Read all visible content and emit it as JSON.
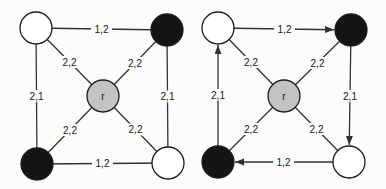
{
  "figure": {
    "background": "#fcfcfb",
    "line_color": "#333333",
    "text_color": "#161616",
    "node_stroke": "#1c1c1c",
    "node_radius": 16,
    "label_font_size": 10,
    "node_colors": {
      "white": "#ffffff",
      "black": "#141414",
      "gray": "#c3c3c2"
    },
    "graphs": [
      {
        "name": "undirected-graph",
        "nodes": [
          {
            "id": "top-left",
            "x": 36,
            "y": 28,
            "fill": "white",
            "label": ""
          },
          {
            "id": "top-right",
            "x": 167,
            "y": 30,
            "fill": "black",
            "label": ""
          },
          {
            "id": "center",
            "x": 103,
            "y": 96,
            "fill": "gray",
            "label": "r"
          },
          {
            "id": "bottom-left",
            "x": 37,
            "y": 164,
            "fill": "black",
            "label": ""
          },
          {
            "id": "bottom-right",
            "x": 168,
            "y": 163,
            "fill": "white",
            "label": ""
          }
        ],
        "edges": [
          {
            "from": "top-left",
            "to": "top-right",
            "label": "1,2",
            "directed": false
          },
          {
            "from": "top-left",
            "to": "bottom-left",
            "label": "2,1",
            "directed": false
          },
          {
            "from": "top-right",
            "to": "bottom-right",
            "label": "2,1",
            "directed": false
          },
          {
            "from": "bottom-right",
            "to": "bottom-left",
            "label": "1,2",
            "directed": false
          },
          {
            "from": "top-left",
            "to": "center",
            "label": "2,2",
            "directed": false
          },
          {
            "from": "top-right",
            "to": "center",
            "label": "2,2",
            "directed": false
          },
          {
            "from": "bottom-left",
            "to": "center",
            "label": "2,2",
            "directed": false
          },
          {
            "from": "bottom-right",
            "to": "center",
            "label": "2,2",
            "directed": false
          }
        ]
      },
      {
        "name": "directed-graph",
        "nodes": [
          {
            "id": "top-left",
            "x": 218,
            "y": 28,
            "fill": "white",
            "label": ""
          },
          {
            "id": "top-right",
            "x": 351,
            "y": 30,
            "fill": "black",
            "label": ""
          },
          {
            "id": "center",
            "x": 284,
            "y": 96,
            "fill": "gray",
            "label": "r"
          },
          {
            "id": "bottom-left",
            "x": 218,
            "y": 162,
            "fill": "black",
            "label": ""
          },
          {
            "id": "bottom-right",
            "x": 349,
            "y": 162,
            "fill": "white",
            "label": ""
          }
        ],
        "edges": [
          {
            "from": "top-left",
            "to": "top-right",
            "label": "1,2",
            "directed": true
          },
          {
            "from": "top-right",
            "to": "bottom-right",
            "label": "2,1",
            "directed": true
          },
          {
            "from": "bottom-right",
            "to": "bottom-left",
            "label": "1,2",
            "directed": true
          },
          {
            "from": "bottom-left",
            "to": "top-left",
            "label": "2,1",
            "directed": true
          },
          {
            "from": "top-left",
            "to": "center",
            "label": "2,2",
            "directed": false
          },
          {
            "from": "top-right",
            "to": "center",
            "label": "2,2",
            "directed": false
          },
          {
            "from": "bottom-left",
            "to": "center",
            "label": "2,2",
            "directed": false
          },
          {
            "from": "bottom-right",
            "to": "center",
            "label": "2,2",
            "directed": false
          }
        ]
      }
    ]
  }
}
